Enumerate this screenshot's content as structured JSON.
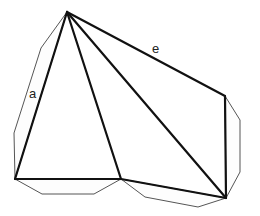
{
  "diagram": {
    "labels": {
      "a": "a",
      "e": "e"
    },
    "vertices": {
      "top": [
        67,
        12
      ],
      "bottom_left": [
        15,
        179
      ],
      "bottom_mid": [
        121,
        179
      ],
      "bottom_right": [
        226,
        198
      ],
      "right_top": [
        225,
        96
      ]
    },
    "colors": {
      "edge": "#111111",
      "flap": "#555555",
      "background": "#ffffff"
    }
  }
}
